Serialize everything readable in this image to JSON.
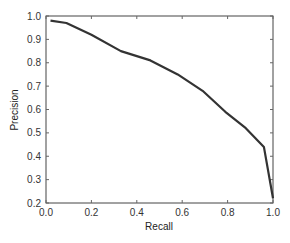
{
  "chart_data": {
    "type": "line",
    "title": "",
    "xlabel": "Recall",
    "ylabel": "Precision",
    "xlim": [
      0.0,
      1.0
    ],
    "ylim": [
      0.2,
      1.0
    ],
    "grid": false,
    "legend": null,
    "x_ticks": [
      "0.0",
      "0.2",
      "0.4",
      "0.6",
      "0.8",
      "1.0"
    ],
    "y_ticks": [
      "0.2",
      "0.3",
      "0.4",
      "0.5",
      "0.6",
      "0.7",
      "0.8",
      "0.9",
      "1.0"
    ],
    "series": [
      {
        "name": "precision-recall",
        "color": "#333333",
        "x": [
          0.02,
          0.09,
          0.2,
          0.33,
          0.46,
          0.58,
          0.69,
          0.79,
          0.88,
          0.96,
          1.0
        ],
        "y": [
          0.98,
          0.97,
          0.92,
          0.85,
          0.81,
          0.75,
          0.68,
          0.59,
          0.52,
          0.44,
          0.22
        ]
      }
    ]
  }
}
